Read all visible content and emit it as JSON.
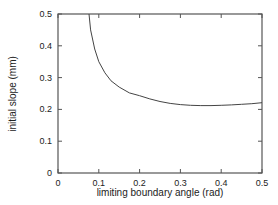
{
  "chart_data": {
    "type": "line",
    "title": "",
    "xlabel": "limiting boundary angle (rad)",
    "ylabel": "initial slope (mm)",
    "xlim": [
      0,
      0.5
    ],
    "ylim": [
      0,
      0.5
    ],
    "xticks": [
      "0",
      "0.1",
      "0.2",
      "0.3",
      "0.4",
      "0.5"
    ],
    "yticks": [
      "0",
      "0.1",
      "0.2",
      "0.3",
      "0.4",
      "0.5"
    ],
    "grid": false,
    "legend": null,
    "series": [
      {
        "name": "initial slope",
        "x": [
          0.076,
          0.08,
          0.09,
          0.1,
          0.115,
          0.13,
          0.15,
          0.175,
          0.2,
          0.225,
          0.25,
          0.275,
          0.3,
          0.325,
          0.35,
          0.375,
          0.4,
          0.425,
          0.45,
          0.475,
          0.5
        ],
        "y": [
          0.5,
          0.45,
          0.39,
          0.35,
          0.315,
          0.29,
          0.27,
          0.252,
          0.243,
          0.233,
          0.225,
          0.219,
          0.215,
          0.213,
          0.212,
          0.212,
          0.213,
          0.214,
          0.216,
          0.218,
          0.221
        ]
      }
    ]
  }
}
